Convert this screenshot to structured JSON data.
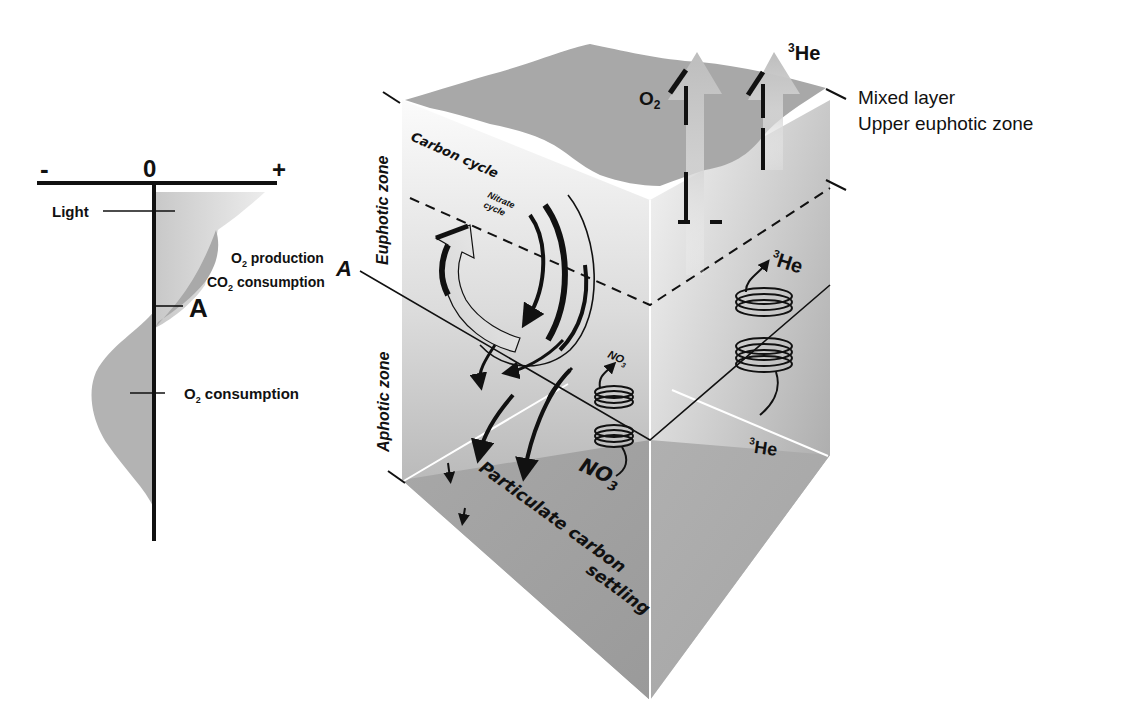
{
  "profile": {
    "axis_minus": "-",
    "axis_zero": "0",
    "axis_plus": "+",
    "light_label": "Light",
    "production_line1_pre": "O",
    "production_line1_sub": "2",
    "production_line1_post": " production",
    "production_line2_pre": "CO",
    "production_line2_sub": "2",
    "production_line2_post": " consumption",
    "marker_a": "A",
    "consumption_pre": "O",
    "consumption_sub": "2",
    "consumption_post": " consumption"
  },
  "block": {
    "euphotic_zone": "Euphotic zone",
    "aphotic_zone": "Aphotic zone",
    "marker_a": "A",
    "carbon_cycle": "Carbon cycle",
    "nitrate_cycle_line1": "Nitrate",
    "nitrate_cycle_line2": "cycle",
    "o2_flux_pre": "O",
    "o2_flux_sub": "2",
    "he_flux_sup": "3",
    "he_flux_main": "He",
    "mixed_layer": "Mixed layer",
    "upper_euphotic": "Upper euphotic zone",
    "he_upper_sup": "3",
    "he_upper_main": "He",
    "he_lower_sup": "3",
    "he_lower_main": "He",
    "no3_small_main": "NO",
    "no3_small_sub": "3",
    "no3_large_main": "NO",
    "no3_large_sub": "3",
    "particulate_line1": "Particulate carbon",
    "particulate_line2": "settling"
  },
  "colors": {
    "surface": "#a9a9a9",
    "face_light": "#f2f2f2",
    "face_dark": "#9a9a9a",
    "profile_light": "#dcdcdc",
    "profile_dark": "#a6a6a6",
    "ink": "#111111"
  }
}
